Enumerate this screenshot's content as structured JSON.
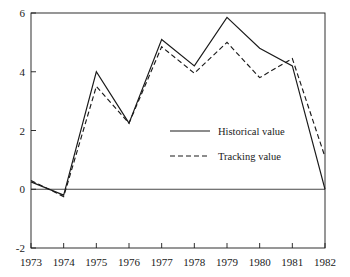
{
  "chart_data": {
    "type": "line",
    "title": "",
    "xlabel": "",
    "ylabel": "",
    "categories": [
      "1973",
      "1974",
      "1975",
      "1976",
      "1977",
      "1978",
      "1979",
      "1980",
      "1981",
      "1982"
    ],
    "x": [
      1973,
      1974,
      1975,
      1976,
      1977,
      1978,
      1979,
      1980,
      1981,
      1982
    ],
    "xlim": [
      1973,
      1982
    ],
    "ylim": [
      -2,
      6
    ],
    "yticks": [
      -2,
      0,
      2,
      4,
      6
    ],
    "ytick_labels": [
      "-2",
      "0",
      "2",
      "4",
      "6"
    ],
    "xtick_labels": [
      "1973",
      "1974",
      "1975",
      "1976",
      "1977",
      "1978",
      "1979",
      "1980",
      "1981",
      "1982"
    ],
    "grid": false,
    "zero_line": true,
    "legend_position": "center",
    "series": [
      {
        "name": "Historical value",
        "style": "solid",
        "color": "#1a1a1a",
        "values": [
          0.25,
          -0.2,
          4.0,
          2.25,
          5.1,
          4.2,
          5.85,
          4.8,
          4.2,
          0.0
        ]
      },
      {
        "name": "Tracking value",
        "style": "dashed",
        "color": "#1a1a1a",
        "values": [
          0.3,
          -0.25,
          3.5,
          2.25,
          4.85,
          3.95,
          5.0,
          3.8,
          4.45,
          1.1
        ]
      }
    ]
  },
  "legend": {
    "items": [
      {
        "label": "Historical value",
        "style": "solid"
      },
      {
        "label": "Tracking value",
        "style": "dashed"
      }
    ]
  },
  "axes": {
    "y_top_label": "6",
    "y_bottom_label": "-2"
  }
}
